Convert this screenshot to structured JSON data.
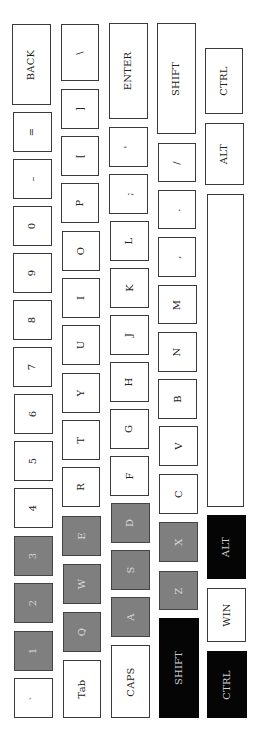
{
  "keyboard": {
    "orientation": "rotated-90-ccw",
    "colors": {
      "normal": "#ffffff",
      "highlight_gray": "#7f7f7f",
      "highlight_black": "#050505",
      "border": "#3a3a3a"
    },
    "keys": [
      {
        "id": "back",
        "label": "BACK",
        "style": "normal",
        "x": 12,
        "y": 24,
        "w": 39,
        "h": 81
      },
      {
        "id": "equals",
        "label": "=",
        "style": "normal",
        "x": 13,
        "y": 112,
        "w": 39,
        "h": 40
      },
      {
        "id": "minus",
        "label": "–",
        "style": "normal",
        "x": 13,
        "y": 159,
        "w": 39,
        "h": 40
      },
      {
        "id": "0",
        "label": "0",
        "style": "normal",
        "x": 13,
        "y": 206,
        "w": 39,
        "h": 40
      },
      {
        "id": "9",
        "label": "9",
        "style": "normal",
        "x": 13,
        "y": 253,
        "w": 39,
        "h": 40
      },
      {
        "id": "8",
        "label": "8",
        "style": "normal",
        "x": 13,
        "y": 300,
        "w": 39,
        "h": 40
      },
      {
        "id": "7",
        "label": "7",
        "style": "normal",
        "x": 13,
        "y": 347,
        "w": 39,
        "h": 40
      },
      {
        "id": "6",
        "label": "6",
        "style": "normal",
        "x": 14,
        "y": 394,
        "w": 39,
        "h": 40
      },
      {
        "id": "5",
        "label": "5",
        "style": "normal",
        "x": 14,
        "y": 441,
        "w": 39,
        "h": 40
      },
      {
        "id": "4",
        "label": "4",
        "style": "normal",
        "x": 14,
        "y": 488,
        "w": 39,
        "h": 40
      },
      {
        "id": "3",
        "label": "3",
        "style": "gray",
        "x": 14,
        "y": 536,
        "w": 39,
        "h": 40
      },
      {
        "id": "2",
        "label": "2",
        "style": "gray",
        "x": 14,
        "y": 583,
        "w": 39,
        "h": 40
      },
      {
        "id": "1",
        "label": "1",
        "style": "gray",
        "x": 14,
        "y": 631,
        "w": 39,
        "h": 40
      },
      {
        "id": "backtick",
        "label": "`",
        "style": "normal",
        "x": 14,
        "y": 678,
        "w": 39,
        "h": 40
      },
      {
        "id": "backslash",
        "label": "\\",
        "style": "normal",
        "x": 61,
        "y": 24,
        "w": 38,
        "h": 57
      },
      {
        "id": "rbracket",
        "label": "]",
        "style": "normal",
        "x": 61,
        "y": 89,
        "w": 38,
        "h": 40
      },
      {
        "id": "lbracket",
        "label": "[",
        "style": "normal",
        "x": 61,
        "y": 136,
        "w": 38,
        "h": 40
      },
      {
        "id": "p",
        "label": "P",
        "style": "normal",
        "x": 61,
        "y": 183,
        "w": 38,
        "h": 40
      },
      {
        "id": "o",
        "label": "O",
        "style": "normal",
        "x": 62,
        "y": 231,
        "w": 38,
        "h": 40
      },
      {
        "id": "i",
        "label": "I",
        "style": "normal",
        "x": 62,
        "y": 278,
        "w": 38,
        "h": 40
      },
      {
        "id": "u",
        "label": "U",
        "style": "normal",
        "x": 62,
        "y": 325,
        "w": 38,
        "h": 40
      },
      {
        "id": "y",
        "label": "Y",
        "style": "normal",
        "x": 62,
        "y": 373,
        "w": 38,
        "h": 40
      },
      {
        "id": "t",
        "label": "T",
        "style": "normal",
        "x": 62,
        "y": 420,
        "w": 38,
        "h": 40
      },
      {
        "id": "r",
        "label": "R",
        "style": "normal",
        "x": 62,
        "y": 467,
        "w": 38,
        "h": 40
      },
      {
        "id": "e",
        "label": "E",
        "style": "gray",
        "x": 62,
        "y": 516,
        "w": 39,
        "h": 40
      },
      {
        "id": "w",
        "label": "W",
        "style": "gray",
        "x": 63,
        "y": 564,
        "w": 38,
        "h": 40
      },
      {
        "id": "q",
        "label": "Q",
        "style": "gray",
        "x": 63,
        "y": 612,
        "w": 38,
        "h": 40
      },
      {
        "id": "tab",
        "label": "Tab",
        "style": "normal",
        "x": 63,
        "y": 660,
        "w": 38,
        "h": 58
      },
      {
        "id": "enter",
        "label": "ENTER",
        "style": "normal",
        "x": 109,
        "y": 23,
        "w": 39,
        "h": 96
      },
      {
        "id": "quote",
        "label": "'",
        "style": "normal",
        "x": 109,
        "y": 127,
        "w": 39,
        "h": 40
      },
      {
        "id": "semicolon",
        "label": ";",
        "style": "normal",
        "x": 109,
        "y": 174,
        "w": 39,
        "h": 40
      },
      {
        "id": "l",
        "label": "L",
        "style": "normal",
        "x": 110,
        "y": 221,
        "w": 39,
        "h": 40
      },
      {
        "id": "k",
        "label": "K",
        "style": "normal",
        "x": 110,
        "y": 268,
        "w": 39,
        "h": 40
      },
      {
        "id": "j",
        "label": "J",
        "style": "normal",
        "x": 110,
        "y": 315,
        "w": 39,
        "h": 40
      },
      {
        "id": "h",
        "label": "H",
        "style": "normal",
        "x": 110,
        "y": 362,
        "w": 39,
        "h": 40
      },
      {
        "id": "g",
        "label": "G",
        "style": "normal",
        "x": 110,
        "y": 409,
        "w": 39,
        "h": 40
      },
      {
        "id": "f",
        "label": "F",
        "style": "normal",
        "x": 110,
        "y": 456,
        "w": 39,
        "h": 40
      },
      {
        "id": "d",
        "label": "D",
        "style": "gray",
        "x": 111,
        "y": 503,
        "w": 39,
        "h": 40
      },
      {
        "id": "s",
        "label": "S",
        "style": "gray",
        "x": 111,
        "y": 550,
        "w": 39,
        "h": 40
      },
      {
        "id": "a",
        "label": "A",
        "style": "gray",
        "x": 111,
        "y": 597,
        "w": 39,
        "h": 40
      },
      {
        "id": "caps",
        "label": "CAPS",
        "style": "normal",
        "x": 111,
        "y": 645,
        "w": 39,
        "h": 73
      },
      {
        "id": "rshift",
        "label": "SHIFT",
        "style": "normal",
        "x": 157,
        "y": 23,
        "w": 39,
        "h": 111
      },
      {
        "id": "slash",
        "label": "/",
        "style": "normal",
        "x": 158,
        "y": 143,
        "w": 38,
        "h": 39
      },
      {
        "id": "period",
        "label": ".",
        "style": "normal",
        "x": 158,
        "y": 190,
        "w": 38,
        "h": 39
      },
      {
        "id": "comma",
        "label": ",",
        "style": "normal",
        "x": 158,
        "y": 237,
        "w": 38,
        "h": 40
      },
      {
        "id": "m",
        "label": "M",
        "style": "normal",
        "x": 158,
        "y": 285,
        "w": 39,
        "h": 39
      },
      {
        "id": "n",
        "label": "N",
        "style": "normal",
        "x": 158,
        "y": 332,
        "w": 39,
        "h": 40
      },
      {
        "id": "b",
        "label": "B",
        "style": "normal",
        "x": 158,
        "y": 379,
        "w": 39,
        "h": 40
      },
      {
        "id": "v",
        "label": "V",
        "style": "normal",
        "x": 159,
        "y": 426,
        "w": 39,
        "h": 40
      },
      {
        "id": "c",
        "label": "C",
        "style": "normal",
        "x": 159,
        "y": 474,
        "w": 39,
        "h": 40
      },
      {
        "id": "x",
        "label": "X",
        "style": "gray",
        "x": 159,
        "y": 522,
        "w": 39,
        "h": 40
      },
      {
        "id": "z",
        "label": "Z",
        "style": "gray",
        "x": 159,
        "y": 571,
        "w": 39,
        "h": 39
      },
      {
        "id": "lshift",
        "label": "SHIFT",
        "style": "black",
        "x": 159,
        "y": 618,
        "w": 40,
        "h": 100
      },
      {
        "id": "rctrl",
        "label": "CTRL",
        "style": "normal",
        "x": 205,
        "y": 48,
        "w": 38,
        "h": 66
      },
      {
        "id": "ralt",
        "label": "ALT",
        "style": "normal",
        "x": 205,
        "y": 123,
        "w": 39,
        "h": 62
      },
      {
        "id": "space",
        "label": "",
        "style": "normal",
        "x": 207,
        "y": 194,
        "w": 37,
        "h": 313
      },
      {
        "id": "lalt",
        "label": "ALT",
        "style": "black",
        "x": 207,
        "y": 515,
        "w": 39,
        "h": 64
      },
      {
        "id": "win",
        "label": "WIN",
        "style": "normal",
        "x": 207,
        "y": 588,
        "w": 39,
        "h": 54
      },
      {
        "id": "lctrl",
        "label": "CTRL",
        "style": "black",
        "x": 207,
        "y": 651,
        "w": 40,
        "h": 67
      }
    ]
  }
}
